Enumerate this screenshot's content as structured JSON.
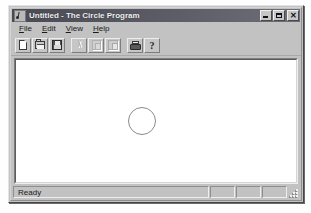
{
  "window": {
    "title": "Untitled - The Circle Program",
    "icon": "circle-program-icon",
    "controls": {
      "minimize_label": "_",
      "maximize_label": "",
      "close_label": "✕"
    }
  },
  "menubar": {
    "items": [
      {
        "name": "file",
        "accel": "F",
        "rest": "ile"
      },
      {
        "name": "edit",
        "accel": "E",
        "rest": "dit"
      },
      {
        "name": "view",
        "accel": "V",
        "rest": "iew"
      },
      {
        "name": "help",
        "accel": "H",
        "rest": "elp"
      }
    ]
  },
  "toolbar": {
    "buttons": [
      {
        "name": "new",
        "icon": "new-document-icon",
        "enabled": true,
        "tooltip": "New"
      },
      {
        "name": "open",
        "icon": "open-folder-icon",
        "enabled": true,
        "tooltip": "Open"
      },
      {
        "name": "save",
        "icon": "floppy-disk-icon",
        "enabled": true,
        "tooltip": "Save"
      },
      {
        "name": "cut",
        "icon": "scissors-icon",
        "enabled": false,
        "tooltip": "Cut"
      },
      {
        "name": "copy",
        "icon": "copy-pages-icon",
        "enabled": false,
        "tooltip": "Copy"
      },
      {
        "name": "paste",
        "icon": "clipboard-icon",
        "enabled": false,
        "tooltip": "Paste"
      },
      {
        "name": "print",
        "icon": "printer-icon",
        "enabled": true,
        "tooltip": "Print"
      },
      {
        "name": "about",
        "icon": "question-mark-icon",
        "enabled": true,
        "tooltip": "About",
        "glyph": "?"
      }
    ]
  },
  "client": {
    "background": "#ffffff",
    "shapes": [
      {
        "name": "circle",
        "type": "ellipse",
        "left_px": 112,
        "top_px": 47,
        "diameter_px": 28,
        "stroke": "#8a8a8a",
        "fill": "none"
      }
    ]
  },
  "statusbar": {
    "message": "Ready",
    "panes": [
      {
        "name": "caps-lock-pane",
        "label": ""
      },
      {
        "name": "num-lock-pane",
        "label": ""
      },
      {
        "name": "scroll-lock-pane",
        "label": ""
      }
    ],
    "grip": "resize-grip"
  },
  "colors": {
    "face": "#c2c2c2",
    "title_active": "#5e5e68",
    "title_text": "#f2f2f2",
    "client_bg": "#ffffff",
    "shape_stroke": "#8a8a8a"
  }
}
